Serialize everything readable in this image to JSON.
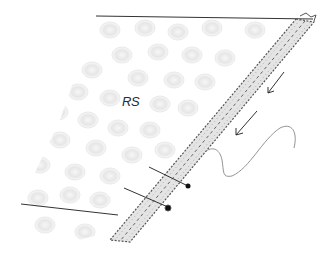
{
  "figure": {
    "type": "knitting-illustration",
    "side_label": "RS",
    "colors": {
      "line": "#333333",
      "bubble": "#d8d8d8",
      "band_fill": "#e6e6e6",
      "band_edge": "#555555",
      "yarn": "#888888",
      "needle_tip": "#111111"
    },
    "elements": {
      "fabric": "textured fabric (right side)",
      "edge_band": "picked-up edge band",
      "arrows": "direction arrows (2)",
      "yarn": "working yarn",
      "needles": "needle markers (2)"
    }
  }
}
